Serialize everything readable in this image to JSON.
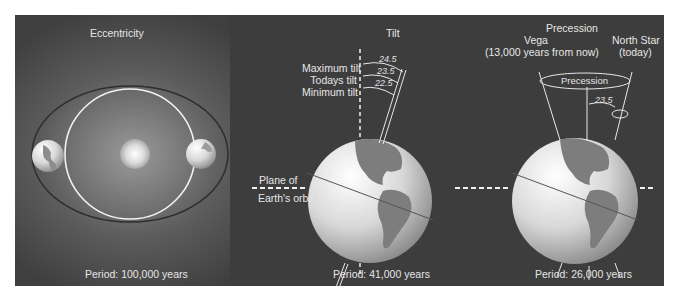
{
  "eccentricity": {
    "title": "Eccentricity",
    "period": "Period: 100,000 years"
  },
  "tilt": {
    "title": "Tilt",
    "labels": [
      "Maximum tilt",
      "Todays tilt",
      "Minimum tilt"
    ],
    "angles": [
      "24.5",
      "23.5",
      "22.5"
    ],
    "plane_label_top": "Plane of",
    "plane_label_bottom": "Earth's orbit",
    "period": "Period: 41,000 years"
  },
  "precession": {
    "title": "Precession",
    "vega_label": "Vega",
    "vega_sub": "(13,000 years from now)",
    "north_star_label": "North Star",
    "north_star_sub": "(today)",
    "cone_label": "Precession",
    "angle": "23.5",
    "period": "Period: 26,000 years"
  },
  "colors": {
    "panel_dark": "#3d3d3d",
    "text": "#e6e6e6",
    "orbit_white": "#f0f0f0",
    "orbit_dark": "#2a2a2a"
  }
}
